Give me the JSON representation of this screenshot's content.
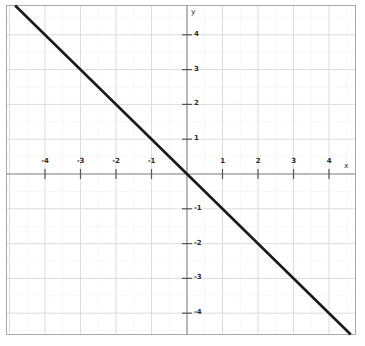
{
  "chart_data": {
    "type": "line",
    "title": "",
    "xlabel": "x",
    "ylabel": "y",
    "xlim": [
      -5.1,
      4.75
    ],
    "ylim": [
      -4.6,
      4.85
    ],
    "grid": true,
    "grid_major_step": 1,
    "grid_minor_step": 0.5,
    "legend": "none",
    "series": [
      {
        "name": "y = -x",
        "equation": "y = -x",
        "slope": -1,
        "intercept": 0,
        "color": "#1a1a1a",
        "x": [
          -5.1,
          4.75
        ],
        "y": [
          5.1,
          -4.75
        ],
        "points": [
          {
            "x": -4,
            "y": 4
          },
          {
            "x": -3,
            "y": 3
          },
          {
            "x": -2,
            "y": 2
          },
          {
            "x": -1,
            "y": 1
          },
          {
            "x": 0,
            "y": 0
          },
          {
            "x": 1,
            "y": -1
          },
          {
            "x": 2,
            "y": -2
          },
          {
            "x": 3,
            "y": -3
          },
          {
            "x": 4,
            "y": -4
          }
        ]
      }
    ],
    "x_ticks": [
      {
        "value": -4,
        "label": "-4"
      },
      {
        "value": -3,
        "label": "-3"
      },
      {
        "value": -2,
        "label": "-2"
      },
      {
        "value": -1,
        "label": "-1"
      },
      {
        "value": 1,
        "label": "1"
      },
      {
        "value": 2,
        "label": "2"
      },
      {
        "value": 3,
        "label": "3"
      },
      {
        "value": 4,
        "label": "4"
      }
    ],
    "y_ticks": [
      {
        "value": 4,
        "label": "4"
      },
      {
        "value": 3,
        "label": "3"
      },
      {
        "value": 2,
        "label": "2"
      },
      {
        "value": 1,
        "label": "1"
      },
      {
        "value": -1,
        "label": "-1"
      },
      {
        "value": -2,
        "label": "-2"
      },
      {
        "value": -3,
        "label": "-3"
      },
      {
        "value": -4,
        "label": "-4"
      }
    ],
    "colors": {
      "line": "#1a1a1a",
      "axis": "#8a8a8a",
      "grid_major": "#dcdcdc",
      "grid_minor": "#e6e6e6",
      "border": "#a8a8a8",
      "background": "#ffffff",
      "label": "#2b2b2b"
    }
  }
}
